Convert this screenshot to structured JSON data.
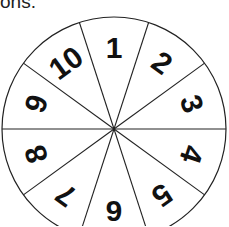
{
  "caption": {
    "text": "ons."
  },
  "spinner": {
    "center": [
      114,
      129
    ],
    "radius": 112,
    "segments": 10,
    "stroke_color": "#222222",
    "labels": [
      "1",
      "2",
      "3",
      "4",
      "5",
      "6",
      "7",
      "8",
      "9",
      "10"
    ]
  }
}
